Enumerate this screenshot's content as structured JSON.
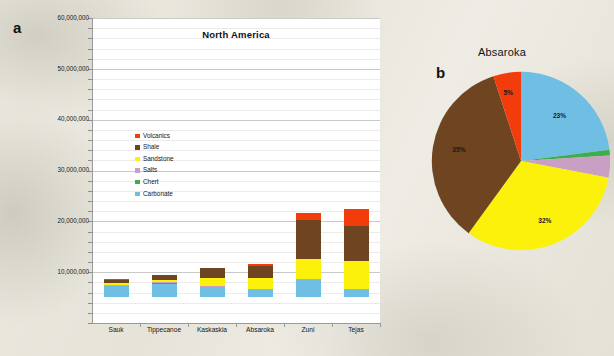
{
  "figure": {
    "panel_a_letter": "a",
    "panel_b_letter": "b"
  },
  "chart_data": [
    {
      "type": "bar",
      "stacked": true,
      "title": "North America",
      "xlabel": "",
      "ylabel": "",
      "ylim": [
        0,
        60000000
      ],
      "ytick_labels": [
        "60,000,000",
        "50,000,000",
        "40,000,000",
        "30,000,000",
        "20,000,000",
        "10,000,000",
        ""
      ],
      "ytick_values": [
        60000000,
        50000000,
        40000000,
        30000000,
        20000000,
        10000000,
        0
      ],
      "minor_gridline_step": 2000000,
      "grid": true,
      "legend_position": "inside-upper-left",
      "categories": [
        "Sauk",
        "Tippecanoe",
        "Kaskaskia",
        "Absaroka",
        "Zuni",
        "Tejas"
      ],
      "series": [
        {
          "name": "Carbonate",
          "color": "#6fbfe5",
          "values": [
            2100000,
            2600000,
            1900000,
            1300000,
            3300000,
            1300000
          ]
        },
        {
          "name": "Chert",
          "color": "#3fae4a",
          "values": [
            60000,
            70000,
            80000,
            90000,
            120000,
            130000
          ]
        },
        {
          "name": "Salts",
          "color": "#c9a0c4",
          "values": [
            50000,
            60000,
            70000,
            180000,
            120000,
            120000
          ]
        },
        {
          "name": "Sandstone",
          "color": "#fbf10a",
          "values": [
            330000,
            400000,
            1500000,
            2100000,
            4000000,
            5600000
          ]
        },
        {
          "name": "Shale",
          "color": "#6e4520",
          "values": [
            700000,
            1000000,
            2000000,
            2300000,
            7600000,
            6900000
          ]
        },
        {
          "name": "Volcanics",
          "color": "#f23c0c",
          "values": [
            20000,
            30000,
            50000,
            450000,
            1400000,
            3300000
          ]
        }
      ],
      "totals": [
        3260000,
        4160000,
        5600000,
        6420000,
        16540000,
        17350000
      ]
    },
    {
      "type": "pie",
      "title": "Absaroka",
      "labels": [
        "Carbonate",
        "Chert",
        "Salts",
        "Sandstone",
        "Shale",
        "Volcanics"
      ],
      "values": [
        23,
        1,
        4,
        32,
        35,
        5
      ],
      "colors": [
        "#6fbfe5",
        "#3fae4a",
        "#c9a0c4",
        "#fbf10a",
        "#6e4520",
        "#f23c0c"
      ],
      "shown_percent_labels": [
        {
          "series": "Carbonate",
          "text": "23%"
        },
        {
          "series": "Sandstone",
          "text": "32%"
        },
        {
          "series": "Shale",
          "text": "35%"
        },
        {
          "series": "Volcanics",
          "text": "5%"
        }
      ]
    }
  ]
}
